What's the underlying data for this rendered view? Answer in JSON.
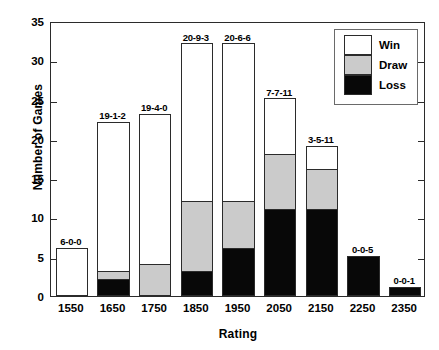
{
  "chart_data": {
    "type": "bar",
    "subtype": "stacked-vertical",
    "title": "",
    "xlabel": "Rating",
    "ylabel": "Number of Games",
    "categories": [
      "1550",
      "1650",
      "1750",
      "1850",
      "1950",
      "2050",
      "2150",
      "2250",
      "2350"
    ],
    "series": [
      {
        "name": "Win",
        "color": "#ffffff",
        "values": [
          6,
          19,
          19,
          20,
          20,
          7,
          3,
          0,
          0
        ]
      },
      {
        "name": "Draw",
        "color": "#cbcbcb",
        "values": [
          0,
          1,
          4,
          9,
          6,
          7,
          5,
          0,
          0
        ]
      },
      {
        "name": "Loss",
        "color": "#080808",
        "values": [
          0,
          2,
          0,
          3,
          6,
          11,
          11,
          5,
          1
        ]
      }
    ],
    "stack_order_bottom_to_top": [
      "Loss",
      "Draw",
      "Win"
    ],
    "totals": [
      6,
      22,
      23,
      32,
      32,
      25,
      19,
      5,
      1
    ],
    "bar_labels": [
      "6-0-0",
      "19-1-2",
      "19-4-0",
      "20-9-3",
      "20-6-6",
      "7-7-11",
      "3-5-11",
      "0-0-5",
      "0-0-1"
    ],
    "bar_label_format": "Win-Draw-Loss",
    "ylim": [
      0,
      35
    ],
    "yticks": [
      0,
      5,
      10,
      15,
      20,
      25,
      30,
      35
    ],
    "ytick_labels": [
      "0",
      "5",
      "10",
      "15",
      "20",
      "25",
      "30",
      "35"
    ],
    "grid": false,
    "legend": {
      "position": "top-right",
      "entries": [
        {
          "label": "Win",
          "color": "#ffffff"
        },
        {
          "label": "Draw",
          "color": "#cbcbcb"
        },
        {
          "label": "Loss",
          "color": "#080808"
        }
      ]
    },
    "frame": true,
    "background": "#ffffff"
  }
}
